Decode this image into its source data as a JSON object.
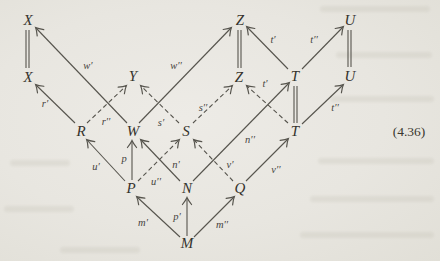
{
  "figure": {
    "equation_number": "(4.36)",
    "nodes": {
      "x_top": "X",
      "z_top": "Z",
      "u_top": "U",
      "x_mid": "X",
      "y": "Y",
      "z_mid": "Z",
      "t_mid": "T",
      "u_mid": "U",
      "r": "R",
      "w": "W",
      "s": "S",
      "t_low": "T",
      "p": "P",
      "n": "N",
      "q": "Q",
      "m": "M"
    },
    "arrow_labels": {
      "w1": "w′",
      "w2": "w′′",
      "t1_top": "t′",
      "t2_top": "t′′",
      "r1": "r′",
      "r2": "r′′",
      "s1": "s′",
      "s2": "s′′",
      "t1_mid": "t′",
      "t2_mid": "t′′",
      "u1": "u′",
      "p": "p",
      "u2": "u′′",
      "n1": "n′",
      "n2": "n′′",
      "v1": "v′",
      "v2": "v′′",
      "m1": "m′",
      "p1": "p′",
      "m2": "m′′"
    },
    "line_color": "#56544d"
  }
}
